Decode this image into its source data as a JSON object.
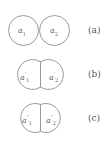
{
  "diagram": {
    "stroke_color": "#9a9a9a",
    "panels": [
      {
        "label": "(a)",
        "left_var": "a",
        "left_sub": "1",
        "left_prime": "",
        "right_var": "a",
        "right_sub": "2",
        "right_prime": "",
        "state": "touching"
      },
      {
        "label": "(b)",
        "left_var": "a",
        "left_sub": "1",
        "left_prime": "′",
        "right_var": "a",
        "right_sub": "2",
        "right_prime": "′",
        "state": "slightly merged"
      },
      {
        "label": "(c)",
        "left_var": "a",
        "left_sub": "1",
        "left_prime": "″",
        "right_var": "a",
        "right_sub": "2",
        "right_prime": "″",
        "state": "merged"
      }
    ]
  }
}
